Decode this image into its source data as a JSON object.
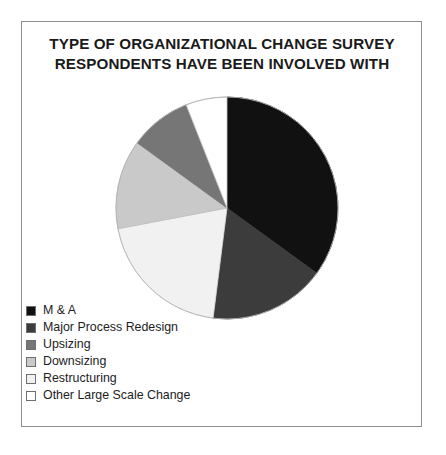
{
  "figure": {
    "background_color": "#ffffff",
    "frame_color": "#8d8d8d"
  },
  "title": "TYPE OF ORGANIZATIONAL CHANGE SURVEY\nRESPONDENTS HAVE BEEN INVOLVED WITH",
  "legend": {
    "items": [
      {
        "label": "M & A",
        "color": "#111111"
      },
      {
        "label": "Major Process Redesign",
        "color": "#3c3c3c"
      },
      {
        "label": "Upsizing",
        "color": "#767676"
      },
      {
        "label": "Downsizing",
        "color": "#c9c9c9"
      },
      {
        "label": "Restructuring",
        "color": "#f1f1f1"
      },
      {
        "label": "Other Large Scale Change",
        "color": "#ffffff"
      }
    ]
  },
  "chart_data": {
    "type": "pie",
    "title": "TYPE OF ORGANIZATIONAL CHANGE SURVEY RESPONDENTS HAVE BEEN INVOLVED WITH",
    "xlabel": "",
    "ylabel": "",
    "legend_position": "bottom-left",
    "grid": false,
    "start_angle_deg": 0,
    "direction": "clockwise",
    "center": {
      "x": 112,
      "y": 112
    },
    "radius": 111,
    "categories": [
      "M & A",
      "Major Process Redesign",
      "Restructuring",
      "Downsizing",
      "Upsizing",
      "Other Large Scale Change"
    ],
    "values": [
      35,
      17,
      20,
      13,
      9,
      6
    ],
    "slices": [
      {
        "label": "M & A",
        "value": 35,
        "color": "#111111",
        "stroke": "#111111"
      },
      {
        "label": "Major Process Redesign",
        "value": 17,
        "color": "#3c3c3c",
        "stroke": "#3c3c3c"
      },
      {
        "label": "Restructuring",
        "value": 20,
        "color": "#f1f1f1",
        "stroke": "#d8d8d8"
      },
      {
        "label": "Downsizing",
        "value": 13,
        "color": "#c9c9c9",
        "stroke": "#bdbdbd"
      },
      {
        "label": "Upsizing",
        "value": 9,
        "color": "#767676",
        "stroke": "#767676"
      },
      {
        "label": "Other Large Scale Change",
        "value": 6,
        "color": "#ffffff",
        "stroke": "#c4c4c4"
      }
    ]
  }
}
